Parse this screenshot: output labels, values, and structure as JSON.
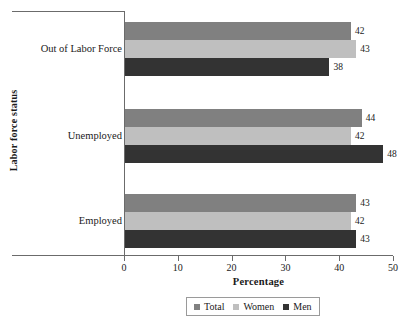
{
  "chart_data": {
    "type": "bar",
    "orientation": "horizontal",
    "title": "",
    "xlabel": "Percentage",
    "ylabel": "Labor force status",
    "categories": [
      "Employed",
      "Unemployed",
      "Out of Labor Force"
    ],
    "series": [
      {
        "name": "Total",
        "color": "#808080",
        "values": [
          43,
          44,
          42
        ]
      },
      {
        "name": "Women",
        "color": "#bfbfbf",
        "values": [
          42,
          42,
          43
        ]
      },
      {
        "name": "Men",
        "color": "#333333",
        "values": [
          43,
          48,
          38
        ]
      }
    ],
    "xlim": [
      0,
      50
    ],
    "xticks": [
      0,
      10,
      20,
      30,
      40,
      50
    ],
    "xtick_labels": [
      "0",
      "10",
      "20",
      "30",
      "40",
      "50"
    ],
    "grid": false,
    "legend_position": "bottom",
    "data_labels": true
  },
  "legend": {
    "items": [
      {
        "label": "Total",
        "color": "#808080"
      },
      {
        "label": "Women",
        "color": "#bfbfbf"
      },
      {
        "label": "Men",
        "color": "#333333"
      }
    ]
  }
}
